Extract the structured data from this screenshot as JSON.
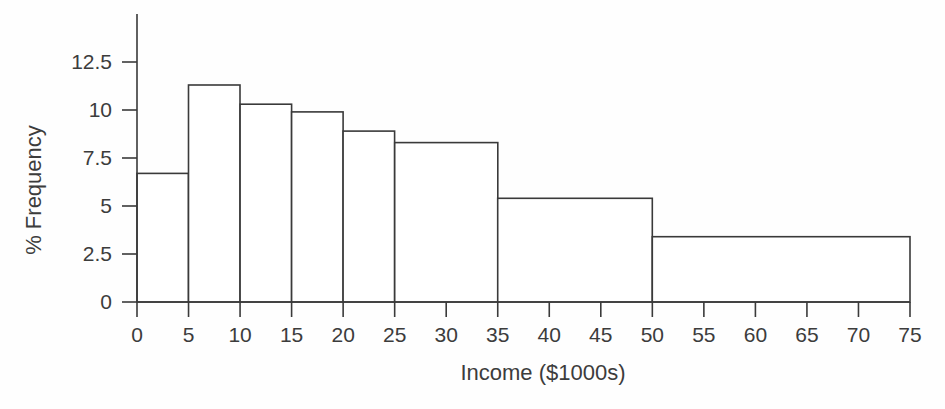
{
  "chart_data": {
    "type": "bar",
    "subtype": "histogram",
    "title": "",
    "xlabel": "Income ($1000s)",
    "ylabel": "% Frequency",
    "bins": [
      {
        "x0": 0,
        "x1": 5,
        "value": 6.7
      },
      {
        "x0": 5,
        "x1": 10,
        "value": 11.3
      },
      {
        "x0": 10,
        "x1": 15,
        "value": 10.3
      },
      {
        "x0": 15,
        "x1": 20,
        "value": 9.9
      },
      {
        "x0": 20,
        "x1": 25,
        "value": 8.9
      },
      {
        "x0": 25,
        "x1": 35,
        "value": 8.3
      },
      {
        "x0": 35,
        "x1": 50,
        "value": 5.4
      },
      {
        "x0": 50,
        "x1": 75,
        "value": 3.4
      }
    ],
    "x_ticks": [
      0,
      5,
      10,
      15,
      20,
      25,
      30,
      35,
      40,
      45,
      50,
      55,
      60,
      65,
      70,
      75
    ],
    "y_ticks": [
      0,
      2.5,
      5,
      7.5,
      10,
      12.5
    ],
    "y_tick_labels": [
      "0",
      "2.5",
      "5",
      "7.5",
      "10",
      "12.5"
    ],
    "xlim": [
      0,
      75
    ],
    "ylim": [
      0,
      15
    ],
    "grid": false,
    "legend": "none",
    "bar_fill": "#ffffff",
    "line_color": "#3a3a3a",
    "text_color": "#3c3c3c"
  }
}
